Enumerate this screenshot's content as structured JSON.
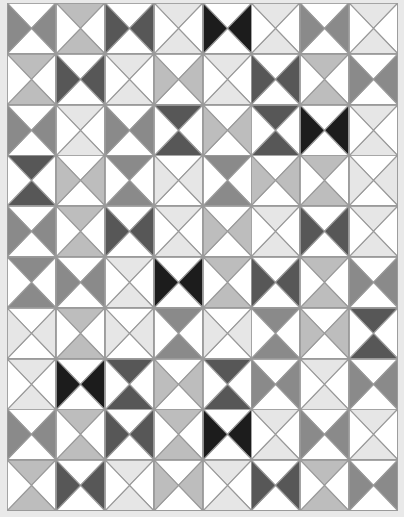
{
  "grid": {
    "columns": 8,
    "rows": 10
  },
  "colors": {
    "background": "#e9e9e9",
    "block_white": "#ffffff",
    "seam": "#9a9a9a",
    "black": "#1c1c1c",
    "dark": "#575757",
    "mid": "#8a8a8a",
    "light": "#bdbdbd",
    "pale": "#e6e6e6"
  },
  "legend": {
    "LR": "colored triangles on left and right",
    "TB": "colored triangles on top and bottom"
  },
  "blocks": [
    [
      [
        "LR",
        "mid"
      ],
      [
        "TB",
        "light"
      ],
      [
        "LR",
        "dark"
      ],
      [
        "TB",
        "pale"
      ],
      [
        "LR",
        "black"
      ],
      [
        "TB",
        "pale"
      ],
      [
        "LR",
        "mid"
      ],
      [
        "TB",
        "pale"
      ]
    ],
    [
      [
        "TB",
        "light"
      ],
      [
        "LR",
        "dark"
      ],
      [
        "TB",
        "pale"
      ],
      [
        "LR",
        "light"
      ],
      [
        "TB",
        "pale"
      ],
      [
        "LR",
        "dark"
      ],
      [
        "TB",
        "light"
      ],
      [
        "LR",
        "mid"
      ]
    ],
    [
      [
        "LR",
        "mid"
      ],
      [
        "TB",
        "pale"
      ],
      [
        "LR",
        "mid"
      ],
      [
        "TB",
        "dark"
      ],
      [
        "LR",
        "light"
      ],
      [
        "TB",
        "dark"
      ],
      [
        "LR",
        "black"
      ],
      [
        "TB",
        "pale"
      ]
    ],
    [
      [
        "TB",
        "dark"
      ],
      [
        "LR",
        "light"
      ],
      [
        "TB",
        "mid"
      ],
      [
        "LR",
        "pale"
      ],
      [
        "TB",
        "mid"
      ],
      [
        "LR",
        "light"
      ],
      [
        "TB",
        "light"
      ],
      [
        "LR",
        "pale"
      ]
    ],
    [
      [
        "LR",
        "mid"
      ],
      [
        "TB",
        "light"
      ],
      [
        "LR",
        "dark"
      ],
      [
        "TB",
        "pale"
      ],
      [
        "LR",
        "light"
      ],
      [
        "TB",
        "pale"
      ],
      [
        "LR",
        "dark"
      ],
      [
        "TB",
        "pale"
      ]
    ],
    [
      [
        "TB",
        "mid"
      ],
      [
        "LR",
        "mid"
      ],
      [
        "TB",
        "pale"
      ],
      [
        "LR",
        "black"
      ],
      [
        "TB",
        "light"
      ],
      [
        "LR",
        "dark"
      ],
      [
        "TB",
        "light"
      ],
      [
        "LR",
        "mid"
      ]
    ],
    [
      [
        "LR",
        "pale"
      ],
      [
        "TB",
        "light"
      ],
      [
        "LR",
        "pale"
      ],
      [
        "TB",
        "mid"
      ],
      [
        "LR",
        "pale"
      ],
      [
        "TB",
        "mid"
      ],
      [
        "LR",
        "light"
      ],
      [
        "TB",
        "dark"
      ]
    ],
    [
      [
        "TB",
        "pale"
      ],
      [
        "LR",
        "black"
      ],
      [
        "TB",
        "dark"
      ],
      [
        "LR",
        "light"
      ],
      [
        "TB",
        "dark"
      ],
      [
        "LR",
        "mid"
      ],
      [
        "TB",
        "pale"
      ],
      [
        "LR",
        "mid"
      ]
    ],
    [
      [
        "LR",
        "mid"
      ],
      [
        "TB",
        "light"
      ],
      [
        "LR",
        "dark"
      ],
      [
        "TB",
        "light"
      ],
      [
        "LR",
        "black"
      ],
      [
        "TB",
        "pale"
      ],
      [
        "LR",
        "mid"
      ],
      [
        "TB",
        "pale"
      ]
    ],
    [
      [
        "TB",
        "light"
      ],
      [
        "LR",
        "dark"
      ],
      [
        "TB",
        "pale"
      ],
      [
        "LR",
        "light"
      ],
      [
        "TB",
        "pale"
      ],
      [
        "LR",
        "dark"
      ],
      [
        "TB",
        "light"
      ],
      [
        "LR",
        "mid"
      ]
    ]
  ]
}
